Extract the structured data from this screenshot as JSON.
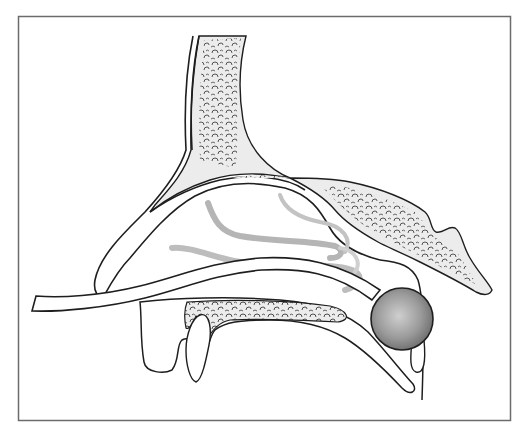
{
  "figure": {
    "title": "Sagittal cross-section of nasal cavity with sphere at soft palate",
    "labels": []
  },
  "colors": {
    "background": "#ffffff",
    "frame": "#6b6b6b",
    "outline": "#1e1e1e",
    "bone_fill": "#ececec",
    "bone_texture": "#3a3a3a",
    "turbinate": "#b8b8b8",
    "sphere_light": "#c9c9c9",
    "sphere_dark": "#6e6e6e"
  },
  "components": [
    {
      "id": "frontal-bone",
      "name": "Frontal / nasal bone"
    },
    {
      "id": "nasal-dorsum",
      "name": "Nasal dorsum outline"
    },
    {
      "id": "sphenoid-bone",
      "name": "Sphenoid / cranial base bone"
    },
    {
      "id": "turbinates",
      "name": "Nasal turbinates"
    },
    {
      "id": "nasal-tube",
      "name": "Tube through nasal passage"
    },
    {
      "id": "hard-palate",
      "name": "Hard palate with teeth"
    },
    {
      "id": "soft-palate",
      "name": "Soft palate"
    },
    {
      "id": "sphere",
      "name": "Sphere at nasopharynx"
    },
    {
      "id": "uvula",
      "name": "Uvula"
    },
    {
      "id": "pharyngeal-wall",
      "name": "Posterior pharyngeal wall"
    }
  ]
}
